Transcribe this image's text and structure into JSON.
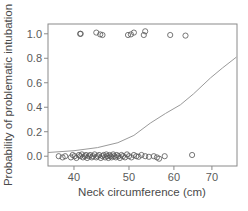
{
  "chart_data": {
    "type": "scatter",
    "title": "",
    "xlabel": "Neck circumference (cm)",
    "ylabel": "Probability of problematic intubation",
    "x_scale": "log",
    "xlim": [
      36,
      77.5
    ],
    "ylim": [
      -0.08,
      1.08
    ],
    "xticks": [
      40,
      50,
      60,
      70
    ],
    "xtick_labels": [
      "40",
      "50",
      "60",
      "70"
    ],
    "yticks": [
      0.0,
      0.2,
      0.4,
      0.6,
      0.8,
      1.0
    ],
    "ytick_labels": [
      "0.0",
      "0.2",
      "0.4",
      "0.6",
      "0.8",
      "1.0"
    ],
    "grid": false,
    "legend": null,
    "series": [
      {
        "name": "Observed outcome = 1",
        "kind": "points",
        "marker": "open-circle",
        "x": [
          41.0,
          41.1,
          43.8,
          44.5,
          44.9,
          49.8,
          50.4,
          51.0,
          53.1,
          53.4,
          59.1,
          62.9
        ],
        "y": [
          1.0,
          1.0,
          1.01,
          0.995,
          0.99,
          0.99,
          0.995,
          1.01,
          0.99,
          1.02,
          0.99,
          0.985
        ]
      },
      {
        "name": "Observed outcome = 0",
        "kind": "points",
        "marker": "open-circle",
        "x": [
          37.6,
          38.2,
          38.6,
          39.5,
          39.8,
          40.1,
          40.4,
          40.8,
          41.0,
          41.3,
          41.5,
          41.8,
          42.0,
          42.2,
          42.5,
          42.7,
          43.0,
          43.2,
          43.5,
          43.8,
          44.0,
          44.3,
          44.6,
          44.9,
          45.1,
          45.4,
          45.6,
          45.8,
          46.0,
          46.2,
          46.4,
          46.6,
          46.9,
          47.1,
          47.4,
          47.6,
          47.9,
          48.2,
          48.5,
          48.8,
          49.2,
          49.6,
          50.0,
          50.5,
          51.0,
          51.5,
          52.0,
          52.6,
          53.4,
          54.2,
          55.3,
          56.0,
          56.5,
          57.8,
          64.6
        ],
        "y": [
          0.0,
          -0.01,
          0.0,
          -0.01,
          0.01,
          0.0,
          -0.015,
          0.01,
          0.0,
          0.015,
          -0.01,
          0.0,
          0.01,
          -0.015,
          0.0,
          0.01,
          -0.01,
          0.0,
          0.015,
          -0.01,
          0.0,
          0.01,
          -0.015,
          0.0,
          0.01,
          -0.01,
          0.015,
          0.0,
          -0.015,
          0.01,
          0.0,
          -0.01,
          0.015,
          0.0,
          -0.01,
          0.01,
          0.0,
          -0.015,
          0.01,
          0.0,
          -0.01,
          0.015,
          0.0,
          -0.01,
          0.01,
          0.0,
          -0.005,
          0.01,
          0.0,
          -0.005,
          0.0,
          -0.01,
          -0.02,
          0.0,
          0.01
        ]
      },
      {
        "name": "Fitted logistic curve",
        "kind": "line",
        "x": [
          36.0,
          40.0,
          44.0,
          47.8,
          51.0,
          54.5,
          58.0,
          61.6,
          65.0,
          69.6,
          73.0,
          77.3
        ],
        "y": [
          0.03,
          0.045,
          0.07,
          0.11,
          0.17,
          0.27,
          0.35,
          0.42,
          0.51,
          0.64,
          0.72,
          0.81
        ]
      }
    ]
  }
}
